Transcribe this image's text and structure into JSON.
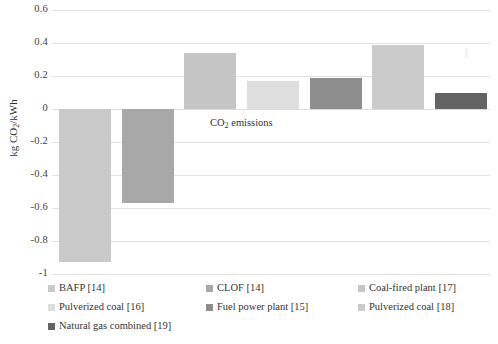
{
  "chart_data": {
    "type": "bar",
    "title": "",
    "xlabel": "CO2 emissions",
    "ylabel": "kg CO2/kWh",
    "ylim": [
      -1,
      0.6
    ],
    "yticks": [
      "0.6",
      "0.4",
      "0.2",
      "0",
      "-0.2",
      "-0.4",
      "-0.6",
      "-0.8",
      "-1"
    ],
    "ytick_values": [
      0.6,
      0.4,
      0.2,
      0,
      -0.2,
      -0.4,
      -0.6,
      -0.8,
      -1
    ],
    "grid": true,
    "legend_position": "bottom",
    "categories": [
      "CO2 emissions"
    ],
    "series": [
      {
        "name": "BAFP [14]",
        "value": -0.93,
        "color": "#c9c9c9"
      },
      {
        "name": "CLOF [14]",
        "value": -0.57,
        "color": "#a8a8a8"
      },
      {
        "name": "Coal-fired plant [17]",
        "value": 0.34,
        "color": "#c5c5c5"
      },
      {
        "name": "Pulverized coal [16]",
        "value": 0.17,
        "color": "#dedede"
      },
      {
        "name": "Fuel power plant [15]",
        "value": 0.19,
        "color": "#8d8d8d"
      },
      {
        "name": "Pulverized coal [18]",
        "value": 0.39,
        "color": "#cbcbcb"
      },
      {
        "name": "Natural gas combined [19]",
        "value": 0.1,
        "color": "#646464"
      }
    ]
  },
  "axis": {
    "y_title_main": "kg CO",
    "y_title_sub": "2",
    "y_title_tail": "/kWh",
    "ticks": [
      "0.6",
      "0.4",
      "0.2",
      "0",
      "-0.2",
      "-0.4",
      "-0.6",
      "-0.8",
      "-1"
    ]
  },
  "category_label": {
    "main": "CO",
    "sub": "2",
    "tail": " emissions"
  },
  "legend": {
    "items": [
      {
        "label": "BAFP [14]",
        "color": "#c9c9c9"
      },
      {
        "label": "CLOF [14]",
        "color": "#a8a8a8"
      },
      {
        "label": "Coal-fired plant [17]",
        "color": "#c5c5c5"
      },
      {
        "label": "Pulverized coal [16]",
        "color": "#dedede"
      },
      {
        "label": "Fuel power plant [15]",
        "color": "#8d8d8d"
      },
      {
        "label": "Pulverized coal [18]",
        "color": "#cbcbcb"
      },
      {
        "label": "Natural gas combined [19]",
        "color": "#646464"
      }
    ]
  }
}
